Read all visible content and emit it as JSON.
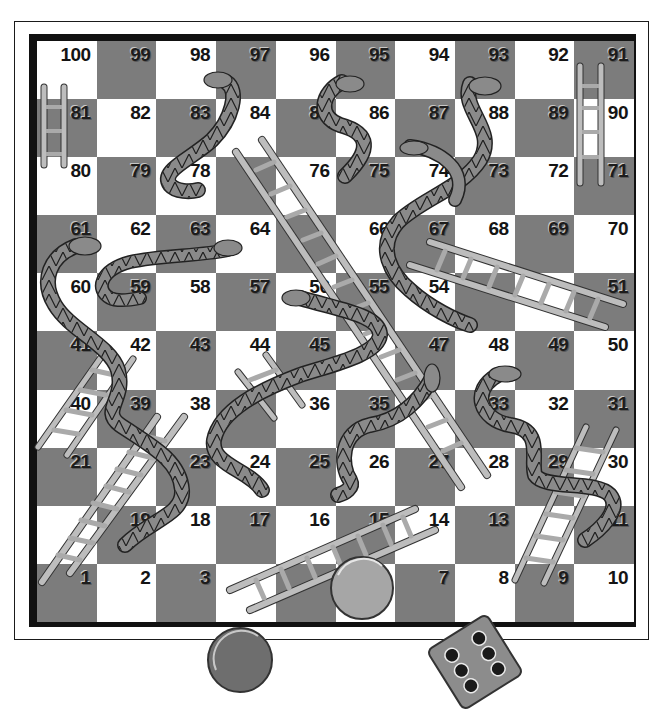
{
  "board": {
    "title": "Snakes and Ladders board",
    "rows": [
      [
        100,
        99,
        98,
        97,
        96,
        95,
        94,
        93,
        92,
        91
      ],
      [
        81,
        82,
        83,
        84,
        85,
        86,
        87,
        88,
        89,
        90
      ],
      [
        80,
        79,
        78,
        77,
        76,
        75,
        74,
        73,
        72,
        71
      ],
      [
        61,
        62,
        63,
        64,
        65,
        66,
        67,
        68,
        69,
        70
      ],
      [
        60,
        59,
        58,
        57,
        56,
        55,
        54,
        53,
        52,
        51
      ],
      [
        41,
        42,
        43,
        44,
        45,
        46,
        47,
        48,
        49,
        50
      ],
      [
        40,
        39,
        38,
        37,
        36,
        35,
        34,
        33,
        32,
        31
      ],
      [
        21,
        22,
        23,
        24,
        25,
        26,
        27,
        28,
        29,
        30
      ],
      [
        20,
        19,
        18,
        17,
        16,
        15,
        14,
        13,
        12,
        11
      ],
      [
        1,
        2,
        3,
        4,
        5,
        6,
        7,
        8,
        9,
        10
      ]
    ],
    "hidden_numbers": [
      77,
      65,
      53,
      52,
      46,
      37,
      34,
      22,
      12,
      6,
      5,
      4,
      20
    ],
    "colors": {
      "dark": "#7c7c7c",
      "light": "#ffffff",
      "border": "#111111",
      "ladder": "#b5b5b5",
      "snake": "#8a8a8a"
    }
  },
  "ladders": [
    {
      "id": "ladder-81-80-left",
      "from": 80,
      "to": 81
    },
    {
      "id": "ladder-91-71-right",
      "from": 71,
      "to": 91
    },
    {
      "id": "ladder-big-diagonal",
      "from": 28,
      "to": 84
    },
    {
      "id": "ladder-51-67",
      "from": 51,
      "to": 67
    },
    {
      "id": "ladder-21-42",
      "from": 21,
      "to": 42
    },
    {
      "id": "ladder-1-38",
      "from": 1,
      "to": 38
    },
    {
      "id": "ladder-24-44",
      "from": 36,
      "to": 44
    },
    {
      "id": "ladder-4-14",
      "from": 4,
      "to": 14
    },
    {
      "id": "ladder-9-30",
      "from": 9,
      "to": 30
    }
  ],
  "snakes": [
    {
      "id": "snake-98-79",
      "head": 98,
      "tail": 79
    },
    {
      "id": "snake-95-75",
      "head": 85,
      "tail": 75
    },
    {
      "id": "snake-93-54",
      "head": 93,
      "tail": 54
    },
    {
      "id": "snake-74-55",
      "head": 74,
      "tail": 55
    },
    {
      "id": "snake-63-60",
      "head": 64,
      "tail": 60
    },
    {
      "id": "snake-61-19",
      "head": 61,
      "tail": 19
    },
    {
      "id": "snake-56-24",
      "head": 56,
      "tail": 24
    },
    {
      "id": "snake-47-26",
      "head": 47,
      "tail": 26
    },
    {
      "id": "snake-33-11",
      "head": 33,
      "tail": 11
    }
  ],
  "pieces": {
    "counter_dark": {
      "color": "#6e6e6e"
    },
    "counter_light": {
      "color": "#a6a6a6"
    },
    "die": {
      "face_value": 6,
      "color": "#8c8c8c"
    }
  }
}
